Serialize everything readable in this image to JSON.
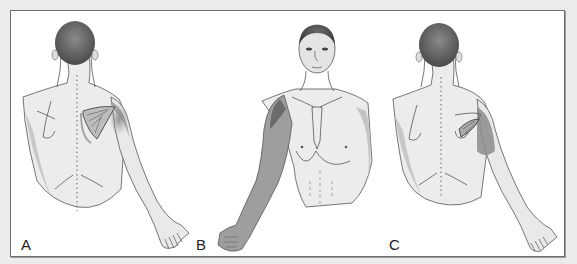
{
  "figure": {
    "background": "#ebebeb",
    "frame_border": "#6e6e6e",
    "panels": [
      {
        "label": "A",
        "view": "posterior",
        "description": "Back view with right scapula muscle highlighted; referred pain shading over shoulder and posterior arm"
      },
      {
        "label": "B",
        "view": "anterior",
        "description": "Front view; referred pain shading over anterior shoulder and lateral arm to hand"
      },
      {
        "label": "C",
        "view": "posterior",
        "description": "Back view with small muscle on scapula highlighted; pain shading over posterior deltoid and upper arm"
      }
    ]
  }
}
